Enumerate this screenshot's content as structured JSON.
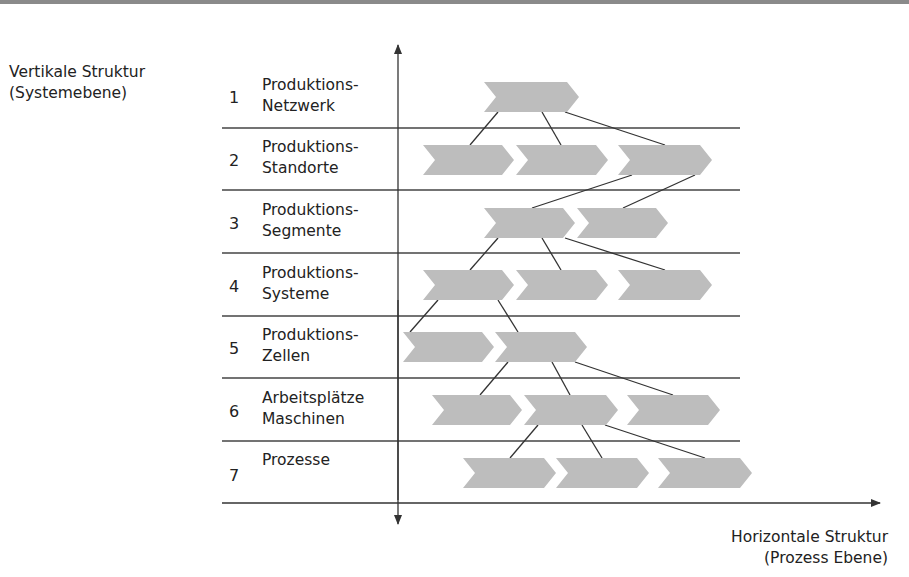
{
  "vertical_axis": {
    "title_line1": "Vertikale Struktur",
    "title_line2": "(Systemebene)"
  },
  "horizontal_axis": {
    "title_line1": "Horizontale Struktur",
    "title_line2": "(Prozess Ebene)"
  },
  "levels": [
    {
      "number": "1",
      "line1": "Produktions-",
      "line2": "Netzwerk"
    },
    {
      "number": "2",
      "line1": "Produktions-",
      "line2": "Standorte"
    },
    {
      "number": "3",
      "line1": "Produktions-",
      "line2": "Segmente"
    },
    {
      "number": "4",
      "line1": "Produktions-",
      "line2": "Systeme"
    },
    {
      "number": "5",
      "line1": "Produktions-",
      "line2": "Zellen"
    },
    {
      "number": "6",
      "line1": "Arbeitsplätze",
      "line2": "Maschinen"
    },
    {
      "number": "7",
      "line1": "Prozesse",
      "line2": ""
    }
  ],
  "colors": {
    "chevron_fill": "#bdbdbd",
    "line": "#333333",
    "text": "#222222"
  }
}
